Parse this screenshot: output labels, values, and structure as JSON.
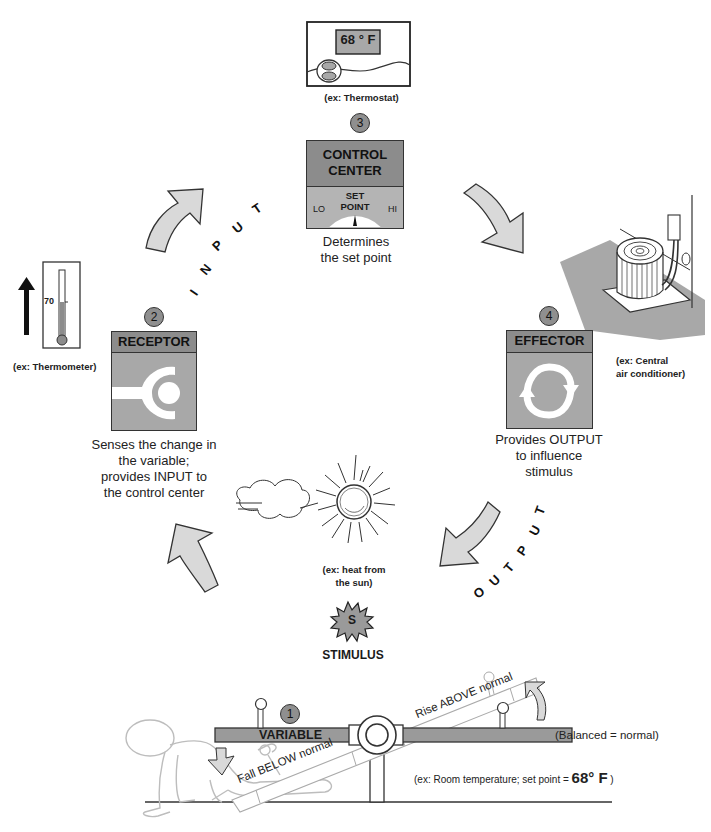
{
  "thermostat": {
    "display": "68 ° F",
    "caption": "(ex:  Thermostat)"
  },
  "control_center": {
    "number": "3",
    "title_line1": "CONTROL",
    "title_line2": "CENTER",
    "set_point_line1": "SET",
    "set_point_line2": "POINT",
    "lo": "LO",
    "hi": "HI",
    "desc_line1": "Determines",
    "desc_line2": "the set point"
  },
  "receptor": {
    "number": "2",
    "title": "RECEPTOR",
    "desc_line1": "Senses the change in",
    "desc_line2": "the variable;",
    "desc_line3": "provides INPUT to",
    "desc_line4": "the control center"
  },
  "thermometer": {
    "reading": "70",
    "caption": "(ex:  Thermometer)"
  },
  "effector": {
    "number": "4",
    "title": "EFFECTOR",
    "desc_line1": "Provides OUTPUT",
    "desc_line2": "to influence",
    "desc_line3": "stimulus"
  },
  "air_conditioner": {
    "caption_line1": "(ex:  Central",
    "caption_line2": "air conditioner)"
  },
  "input_label": [
    "I",
    "N",
    "P",
    "U",
    "T"
  ],
  "output_label": [
    "O",
    "U",
    "T",
    "P",
    "U",
    "T"
  ],
  "sun": {
    "caption_line1": "(ex:  heat from",
    "caption_line2": "the sun)"
  },
  "stimulus": {
    "badge": "S",
    "label": "STIMULUS"
  },
  "variable": {
    "number": "1",
    "title": "VARIABLE",
    "fall_label": "Fall BELOW normal",
    "rise_label": "Rise ABOVE normal",
    "balanced_label": "(Balanced = normal)",
    "example_prefix": "(ex:  Room temperature;  set point = ",
    "example_value": "68° F",
    "example_suffix": " )"
  },
  "colors": {
    "box_fill": "#a8a8a8",
    "box_header": "#8c8c8c",
    "arrow_fill": "#d9d9d9",
    "outline": "#333333",
    "figure_stroke": "#bdbdbd"
  }
}
